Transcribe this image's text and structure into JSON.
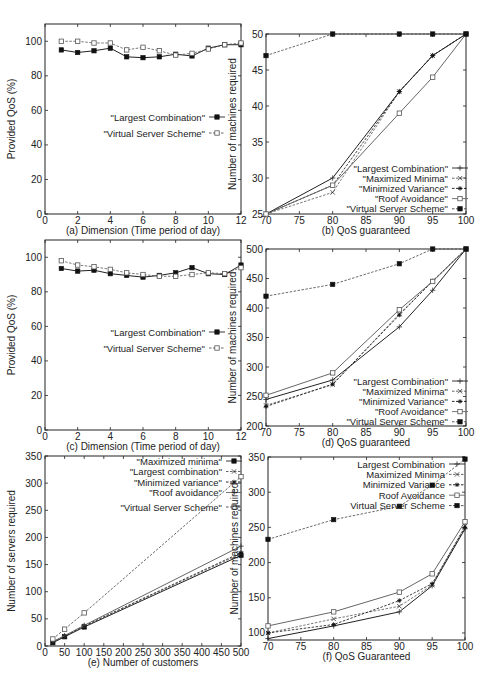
{
  "chart_data": [
    {
      "id": "a",
      "type": "line",
      "caption": "(a)  Dimension (Time period of day)",
      "xlabel": "(a)  Dimension (Time period of day)",
      "ylabel": "Provided QoS (%)",
      "xlim": [
        0,
        12
      ],
      "ylim": [
        0,
        110
      ],
      "xticks": [
        0,
        2,
        4,
        6,
        8,
        10,
        12
      ],
      "yticks": [
        0,
        20,
        40,
        60,
        80,
        100
      ],
      "legend_position": "center-right",
      "x": [
        1,
        2,
        3,
        4,
        5,
        6,
        7,
        8,
        9,
        10,
        11,
        12
      ],
      "series": [
        {
          "name": "\"Largest Combination\"",
          "style": "solid",
          "marker": "filled-square",
          "values": [
            95,
            93.5,
            94.5,
            96,
            91,
            90.5,
            91,
            92.5,
            91.5,
            96,
            98,
            98
          ]
        },
        {
          "name": "\"Virtual Server Scheme\"",
          "style": "dashed",
          "marker": "open-square",
          "values": [
            100,
            100,
            99,
            99,
            95,
            96.5,
            94.5,
            92,
            93,
            95.5,
            98,
            99
          ]
        }
      ]
    },
    {
      "id": "b",
      "type": "line",
      "caption": "(b)  QoS guaranteed",
      "xlabel": "(b)  QoS guaranteed",
      "ylabel": "Number of machines required",
      "xlim": [
        70,
        100
      ],
      "ylim": [
        25,
        50
      ],
      "xticks": [
        70,
        75,
        80,
        85,
        90,
        95,
        100
      ],
      "yticks": [
        25,
        30,
        35,
        40,
        45,
        50
      ],
      "legend_position": "bottom-right",
      "x": [
        70,
        80,
        90,
        95,
        100
      ],
      "series": [
        {
          "name": "\"Largest Combination\"",
          "style": "solid",
          "marker": "plus",
          "values": [
            25,
            30,
            42,
            47,
            50
          ]
        },
        {
          "name": "\"Maximized Minima\"",
          "style": "dashed",
          "marker": "x",
          "values": [
            25,
            28,
            42,
            47,
            50
          ]
        },
        {
          "name": "\"Minimized Variance\"",
          "style": "dashed",
          "marker": "star",
          "values": [
            25,
            29,
            42,
            47,
            50
          ]
        },
        {
          "name": "\"Roof Avoidance\"",
          "style": "solid",
          "marker": "open-square",
          "values": [
            25,
            29,
            39,
            44,
            50
          ]
        },
        {
          "name": "\"Virtual Server Scheme\"",
          "style": "dashed",
          "marker": "filled-square",
          "values": [
            47,
            50,
            50,
            50,
            50
          ]
        }
      ]
    },
    {
      "id": "c",
      "type": "line",
      "caption": "(c)  Dimension (Time period of day)",
      "xlabel": "(c)  Dimension (Time period of day)",
      "ylabel": "Provided QoS (%)",
      "xlim": [
        0,
        12
      ],
      "ylim": [
        0,
        110
      ],
      "xticks": [
        0,
        2,
        4,
        6,
        8,
        10,
        12
      ],
      "yticks": [
        0,
        20,
        40,
        60,
        80,
        100
      ],
      "legend_position": "center-right",
      "x": [
        1,
        2,
        3,
        4,
        5,
        6,
        7,
        8,
        9,
        10,
        11,
        12
      ],
      "series": [
        {
          "name": "\"Largest Combination\"",
          "style": "solid",
          "marker": "filled-square",
          "values": [
            93.5,
            92,
            92.5,
            90.5,
            89.5,
            88.5,
            89.5,
            91,
            94,
            90.5,
            90,
            95.5
          ]
        },
        {
          "name": "\"Virtual Server Scheme\"",
          "style": "dashed",
          "marker": "open-square",
          "values": [
            98,
            95.5,
            94.5,
            93,
            91,
            90,
            89,
            89,
            90,
            91,
            90.5,
            94
          ]
        }
      ]
    },
    {
      "id": "d",
      "type": "line",
      "caption": "(d)  QoS guaranteed",
      "xlabel": "(d)  QoS guaranteed",
      "ylabel": "Number of machines required",
      "xlim": [
        70,
        100
      ],
      "ylim": [
        200,
        500
      ],
      "xticks": [
        70,
        75,
        80,
        85,
        90,
        95,
        100
      ],
      "yticks": [
        200,
        250,
        300,
        350,
        400,
        450,
        500
      ],
      "legend_position": "bottom-right",
      "x": [
        70,
        80,
        90,
        95,
        100
      ],
      "series": [
        {
          "name": "\"Largest Combination\"",
          "style": "solid",
          "marker": "plus",
          "values": [
            245,
            278,
            368,
            430,
            500
          ]
        },
        {
          "name": "\"Maximized Minima\"",
          "style": "dashed",
          "marker": "x",
          "values": [
            235,
            270,
            390,
            445,
            500
          ]
        },
        {
          "name": "\"Minimized Variance\"",
          "style": "dashed",
          "marker": "star",
          "values": [
            233,
            271,
            388,
            446,
            500
          ]
        },
        {
          "name": "\"Roof Avoidance\"",
          "style": "solid",
          "marker": "open-square",
          "values": [
            252,
            290,
            397,
            445,
            500
          ]
        },
        {
          "name": "\"Virtual Server Scheme\"",
          "style": "dashed",
          "marker": "filled-square",
          "values": [
            420,
            440,
            475,
            500,
            500
          ]
        }
      ]
    },
    {
      "id": "e",
      "type": "line",
      "caption": "(e)  Number of customers",
      "xlabel": "(e)  Number of customers",
      "ylabel": "Number of servers required",
      "xlim": [
        0,
        500
      ],
      "ylim": [
        0,
        350
      ],
      "xticks": [
        0,
        50,
        100,
        150,
        200,
        250,
        300,
        350,
        400,
        450,
        500
      ],
      "yticks": [
        0,
        50,
        100,
        150,
        200,
        250,
        300,
        350
      ],
      "legend_position": "top-right",
      "x": [
        20,
        50,
        100,
        500
      ],
      "series": [
        {
          "name": "\"Maximized minima\"",
          "style": "solid",
          "marker": "filled-square",
          "values": [
            6,
            17,
            35,
            167
          ]
        },
        {
          "name": "\"Largest combination\"",
          "style": "dashed",
          "marker": "x",
          "values": [
            7,
            18,
            36,
            170
          ]
        },
        {
          "name": "\"Minimized variance\"",
          "style": "dashed",
          "marker": "star",
          "values": [
            7,
            18,
            37,
            172
          ]
        },
        {
          "name": "\"Roof avoidance\"",
          "style": "solid",
          "marker": "plus",
          "values": [
            8,
            19,
            38,
            184
          ]
        },
        {
          "name": "\"Virtual Server Scheme\"",
          "style": "dashed",
          "marker": "open-square",
          "values": [
            13,
            31,
            61,
            312
          ]
        }
      ]
    },
    {
      "id": "f",
      "type": "line",
      "caption": "(f)  QoS Guaranteed",
      "xlabel": "(f)  QoS Guaranteed",
      "ylabel": "Number of machines required",
      "xlim": [
        70,
        100
      ],
      "ylim": [
        90,
        350
      ],
      "xticks": [
        70,
        75,
        80,
        85,
        90,
        95,
        100
      ],
      "yticks": [
        100,
        150,
        200,
        250,
        300,
        350
      ],
      "legend_position": "top-right",
      "x": [
        70,
        80,
        90,
        95,
        100
      ],
      "series": [
        {
          "name": "Largest Combination",
          "style": "solid",
          "marker": "plus",
          "values": [
            92,
            110,
            130,
            167,
            248
          ]
        },
        {
          "name": "Maximized Minima",
          "style": "dashed",
          "marker": "x",
          "values": [
            100,
            120,
            138,
            168,
            252
          ]
        },
        {
          "name": "Minimized Variance",
          "style": "dashed",
          "marker": "star",
          "values": [
            100,
            112,
            146,
            170,
            250
          ]
        },
        {
          "name": "Roof Avoidance",
          "style": "solid",
          "marker": "open-square",
          "values": [
            110,
            130,
            158,
            184,
            258
          ]
        },
        {
          "name": "Virtual Server Scheme",
          "style": "dashed",
          "marker": "filled-square",
          "values": [
            233,
            261,
            280,
            310,
            347
          ]
        }
      ]
    }
  ]
}
